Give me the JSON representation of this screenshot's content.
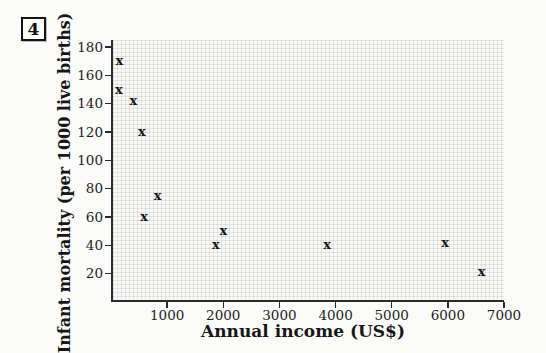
{
  "figure": {
    "number": "4"
  },
  "chart_data": {
    "type": "scatter",
    "title": "",
    "xlabel": "Annual income (US$)",
    "ylabel": "Infant mortality (per 1000 live births)",
    "marker_glyph": "x",
    "grid": "fine graph-paper grid, on",
    "legend": "none",
    "xlim": [
      0,
      7000
    ],
    "ylim": [
      0,
      185
    ],
    "x_ticks": [
      1000,
      2000,
      3000,
      4000,
      5000,
      6000,
      7000
    ],
    "y_ticks": [
      20,
      40,
      60,
      80,
      100,
      120,
      140,
      160,
      180
    ],
    "points": [
      {
        "x": 140,
        "y": 150
      },
      {
        "x": 150,
        "y": 170
      },
      {
        "x": 400,
        "y": 142
      },
      {
        "x": 550,
        "y": 120
      },
      {
        "x": 590,
        "y": 60
      },
      {
        "x": 830,
        "y": 75
      },
      {
        "x": 1870,
        "y": 40
      },
      {
        "x": 2000,
        "y": 50
      },
      {
        "x": 3850,
        "y": 40
      },
      {
        "x": 5950,
        "y": 42
      },
      {
        "x": 6600,
        "y": 21
      }
    ],
    "colors": {
      "marker": "#161616",
      "axis": "#2b2b2b",
      "grid_line": "#e2e2e0",
      "background": "#fbfbf9",
      "text": "#1d1d1d"
    }
  }
}
